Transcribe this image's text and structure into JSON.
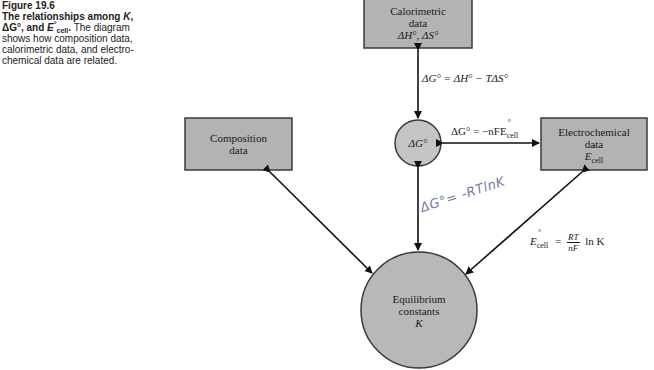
{
  "caption": {
    "number": "Figure 19.6",
    "title_parts": [
      "The relationships among ",
      "K",
      ",",
      "ΔG°",
      ", and ",
      "E",
      "cell",
      "°",
      "."
    ],
    "body": "The diagram shows how composition data, calorimetric data, and electro-chemical data are related."
  },
  "nodes": {
    "calorimetric": {
      "line1": "Calorimetric",
      "line2": "data",
      "line3": "ΔH°, ΔS°"
    },
    "composition": {
      "line1": "Composition",
      "line2": "data"
    },
    "delta_g": {
      "label": "ΔG°"
    },
    "electrochemical": {
      "line1": "Electrochemical",
      "line2": "data",
      "line3_main": "E",
      "line3_sub": "cell",
      "line3_sup": "°"
    },
    "equilibrium": {
      "line1": "Equilibrium",
      "line2": "constants",
      "line3": "K"
    }
  },
  "equations": {
    "gibbs_enthalpy": "ΔG° = ΔH° − TΔS°",
    "gibbs_cell_lhs": "ΔG° = −nFE",
    "gibbs_cell_sub": "cell",
    "gibbs_cell_sup": "°",
    "nernst_lhs_main": "E",
    "nernst_lhs_sub": "cell",
    "nernst_lhs_sup": "°",
    "nernst_eq": "=",
    "nernst_num": "RT",
    "nernst_den": "nF",
    "nernst_tail": "ln  K",
    "handwritten": "ΔG°= -RTlnK"
  },
  "colors": {
    "box_fill": "#b3b3b3",
    "box_stroke": "#3a3a3a",
    "arrow": "#111111",
    "handwriting": "#6f7ba0"
  }
}
